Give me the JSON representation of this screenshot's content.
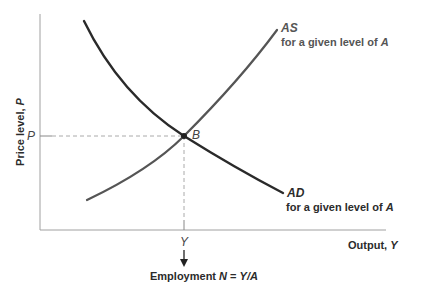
{
  "diagram": {
    "title": "",
    "axes": {
      "y_label": "Price level, ",
      "y_label_var": "P",
      "x_label": "Output, ",
      "x_label_var": "Y",
      "y_tick": "P",
      "x_tick": "Y"
    },
    "curves": {
      "as": {
        "name": "AS",
        "caption": "for a given level of ",
        "caption_var": "A",
        "color": "#555555"
      },
      "ad": {
        "name": "AD",
        "caption": "for a given level of ",
        "caption_var": "A",
        "color": "#2a2a2a"
      }
    },
    "equilibrium": {
      "label": "B"
    },
    "employment": {
      "label": "Employment ",
      "formula_var": "N",
      "formula_eq": " = ",
      "formula_rhs": "Y/A"
    },
    "colors": {
      "axis": "#9a9a9a",
      "dashed": "#aaaaaa",
      "text": "#2b2b2b"
    }
  }
}
